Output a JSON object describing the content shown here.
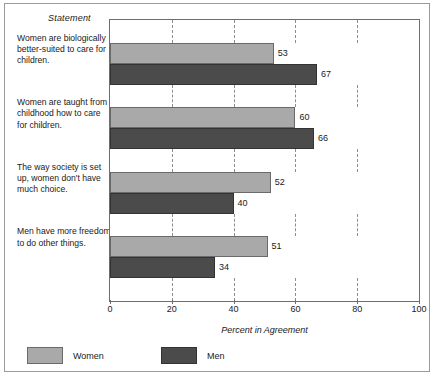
{
  "figure": {
    "statement_header": "Statement",
    "xlabel": "Percent in Agreement"
  },
  "chart_data": {
    "type": "bar",
    "orientation": "horizontal",
    "title": "",
    "subtitle": "",
    "xlabel": "Percent in Agreement",
    "ylabel": "Statement",
    "xlim": [
      0,
      100
    ],
    "xticks": [
      0,
      20,
      40,
      60,
      80,
      100
    ],
    "grid": "dashed-vertical",
    "legend_position": "bottom-left",
    "categories": [
      "Women are biologically better-suited to care for children.",
      "Women are taught from childhood how to care for children.",
      "The way society is set up, women don't have much choice.",
      "Men have more freedom to do other things."
    ],
    "series": [
      {
        "name": "Women",
        "color": "#a9a9a9",
        "values": [
          53,
          60,
          52,
          51
        ]
      },
      {
        "name": "Men",
        "color": "#4b4b4b",
        "values": [
          67,
          66,
          40,
          34
        ]
      }
    ]
  },
  "legend": [
    {
      "label": "Women",
      "color": "#a9a9a9"
    },
    {
      "label": "Men",
      "color": "#4b4b4b"
    }
  ]
}
